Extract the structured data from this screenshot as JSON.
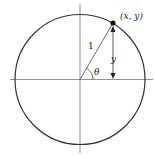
{
  "diagram": {
    "point_label": "(x, y)",
    "radius_label": "1",
    "height_label": "y",
    "angle_label": "θ",
    "colors": {
      "stroke": "#333333",
      "axis": "#666666",
      "point": "#111111",
      "background": "#ffffff"
    },
    "geometry": {
      "center": [
        80,
        79.5
      ],
      "radius": 65,
      "point": [
        113,
        23
      ]
    }
  }
}
